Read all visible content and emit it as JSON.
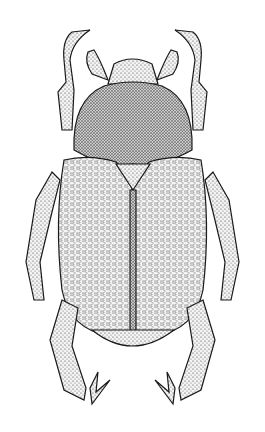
{
  "image": {
    "subject": "beetle",
    "style": "stipple ink illustration",
    "view": "dorsal",
    "background": "#ffffff",
    "ink": "#1a1a1a"
  },
  "parts": [
    "head",
    "pronotum",
    "scutellum",
    "left-elytron",
    "right-elytron",
    "pygidium",
    "front-legs",
    "middle-legs",
    "hind-legs",
    "antennae"
  ]
}
